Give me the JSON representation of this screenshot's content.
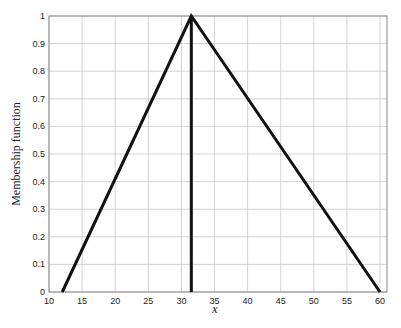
{
  "chart_data": {
    "type": "line",
    "title": "",
    "xlabel": "x",
    "ylabel": "Membership function",
    "xlim": [
      10,
      60
    ],
    "ylim": [
      0,
      1
    ],
    "grid": true,
    "legend": null,
    "xticks": [
      10,
      15,
      20,
      25,
      30,
      35,
      40,
      45,
      50,
      55,
      60
    ],
    "yticks": [
      0,
      0.1,
      0.2,
      0.3,
      0.4,
      0.5,
      0.6,
      0.7,
      0.8,
      0.9,
      1
    ],
    "ytick_labels": [
      "0",
      "0.1",
      "0.2",
      "0.3",
      "0.4",
      "0.5",
      "0.6",
      "0.7",
      "0.8",
      "0.9",
      "1"
    ],
    "series": [
      {
        "name": "triangular membership",
        "x": [
          12,
          31.5,
          60
        ],
        "y": [
          0,
          1,
          0
        ],
        "color": "#111111"
      },
      {
        "name": "peak marker",
        "x": [
          31.5,
          31.5
        ],
        "y": [
          0,
          1
        ],
        "color": "#111111"
      }
    ]
  }
}
